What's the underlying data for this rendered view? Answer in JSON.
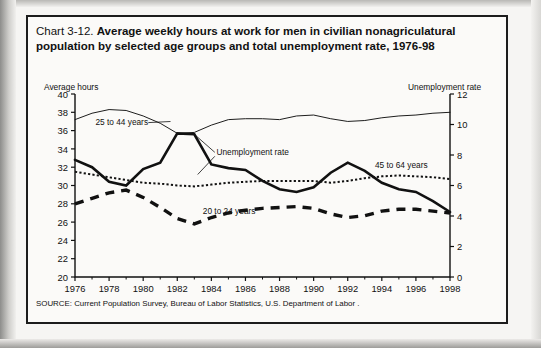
{
  "title": {
    "prefix": "Chart 3-12.",
    "text": "Average weekly hours at work for men in civilian nonagriculatural population by selected age groups and total unemployment rate, 1976-98"
  },
  "source": "SOURCE: Current Population Survey, Bureau of Labor Statistics, U.S. Department of Labor .",
  "axis_caption_left": "Average hours",
  "axis_caption_right": "Unemployment rate",
  "chart_data": {
    "type": "line",
    "title": "Average weekly hours at work for men in civilian nonagriculatural population by selected age groups and total unemployment rate, 1976-98",
    "xlabel": "",
    "ylabel": "Average hours",
    "y2label": "Unemployment rate",
    "ylim": [
      20,
      40
    ],
    "y2lim": [
      0,
      12
    ],
    "ytick_step": 2,
    "y2tick_step": 2,
    "xlim": [
      1976,
      1998
    ],
    "xticks": [
      1976,
      1978,
      1980,
      1982,
      1984,
      1986,
      1988,
      1990,
      1992,
      1994,
      1996,
      1998
    ],
    "xtick_labels": [
      "1976",
      "1978",
      "1980",
      "1982",
      "1984",
      "1986",
      "1988",
      "1990",
      "1992",
      "1994",
      "1996",
      "1998"
    ],
    "minor_xticks": [
      1977,
      1979,
      1981,
      1983,
      1985,
      1987,
      1989,
      1991,
      1993,
      1995,
      1997
    ],
    "grid": false,
    "legend": "inline-annotations",
    "x": [
      1976,
      1977,
      1978,
      1979,
      1980,
      1981,
      1982,
      1983,
      1984,
      1985,
      1986,
      1987,
      1988,
      1989,
      1990,
      1991,
      1992,
      1993,
      1994,
      1995,
      1996,
      1997,
      1998
    ],
    "series": [
      {
        "name": "25 to 44 years",
        "axis": "left",
        "style": "thin-solid",
        "units": "hours",
        "values": [
          37.2,
          37.9,
          38.3,
          38.2,
          37.6,
          36.8,
          35.7,
          35.8,
          36.6,
          37.2,
          37.3,
          37.3,
          37.2,
          37.6,
          37.7,
          37.3,
          37.0,
          37.1,
          37.4,
          37.6,
          37.7,
          37.9,
          38.0
        ]
      },
      {
        "name": "45 to 64 years",
        "axis": "left",
        "style": "dotted",
        "units": "hours",
        "values": [
          31.5,
          31.2,
          30.9,
          30.6,
          30.3,
          30.2,
          30.0,
          29.9,
          30.1,
          30.3,
          30.4,
          30.5,
          30.5,
          30.5,
          30.5,
          30.3,
          30.5,
          30.8,
          31.0,
          31.1,
          31.0,
          30.9,
          30.7
        ]
      },
      {
        "name": "20 to 24 years",
        "axis": "left",
        "style": "thick-dashed",
        "units": "hours",
        "values": [
          28.0,
          28.6,
          29.2,
          29.5,
          28.7,
          27.6,
          26.4,
          25.8,
          26.5,
          27.0,
          27.3,
          27.5,
          27.6,
          27.7,
          27.5,
          26.9,
          26.5,
          26.7,
          27.2,
          27.4,
          27.4,
          27.2,
          27.0
        ]
      },
      {
        "name": "Unemployment rate",
        "axis": "right",
        "style": "thick-solid",
        "units": "percent",
        "values": [
          7.7,
          7.1,
          6.1,
          5.8,
          7.1,
          7.6,
          9.7,
          9.6,
          7.5,
          7.2,
          7.0,
          6.2,
          5.5,
          5.3,
          5.6,
          6.8,
          7.5,
          6.9,
          6.1,
          5.6,
          5.4,
          4.9,
          4.5
        ],
        "values_left_scale": [
          32.8,
          32.0,
          30.4,
          30.0,
          31.8,
          32.5,
          35.7,
          35.6,
          32.3,
          31.9,
          31.7,
          30.5,
          29.6,
          29.3,
          29.8,
          31.4,
          32.5,
          31.6,
          30.3,
          29.6,
          29.3,
          28.3,
          27.1
        ]
      }
    ],
    "annotations": [
      {
        "text": "25 to 44 years",
        "x": 1977.2,
        "y": 36.6
      },
      {
        "text": "Unemployment rate",
        "x": 1984.3,
        "y": 33.3
      },
      {
        "text": "45 to 64 years",
        "x": 1993.6,
        "y": 31.9
      },
      {
        "text": "20 to 24 years",
        "x": 1983.5,
        "y": 26.9
      }
    ]
  }
}
